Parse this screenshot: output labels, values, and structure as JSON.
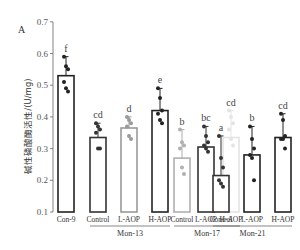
{
  "panel_label": "A",
  "chart_data": {
    "type": "bar",
    "title": "",
    "xlabel": "",
    "ylabel": "碱性磷酸酶活性/(U/mg)",
    "ylim": [
      0.1,
      0.7
    ],
    "yticks": [
      0.1,
      0.2,
      0.3,
      0.4,
      0.5,
      0.6,
      0.7
    ],
    "grid": false,
    "legend": "none",
    "categories": [
      "Con-9",
      "Control",
      "L-AOP",
      "H-AOP",
      "Control",
      "L-AOP",
      "H-AOP",
      "Control",
      "L-AOP",
      "H-AOP"
    ],
    "groups": [
      {
        "label": "",
        "categories": [
          "Con-9"
        ]
      },
      {
        "label": "Mon-13",
        "categories": [
          "Control",
          "L-AOP",
          "H-AOP"
        ]
      },
      {
        "label": "Mon-17",
        "categories": [
          "Control",
          "L-AOP",
          "H-AOP"
        ]
      },
      {
        "label": "Mon-21",
        "categories": [
          "Control",
          "L-AOP",
          "H-AOP"
        ]
      }
    ],
    "values": [
      0.53,
      0.335,
      0.365,
      0.42,
      0.27,
      0.305,
      0.335,
      0.215,
      0.28,
      0.335
    ],
    "error_top": [
      0.59,
      0.38,
      0.4,
      0.49,
      0.36,
      0.37,
      0.42,
      0.34,
      0.37,
      0.41
    ],
    "significance_letters": [
      "f",
      "cd",
      "d",
      "e",
      "b",
      "bc",
      "cd",
      "a",
      "b",
      "cd"
    ],
    "bar_colors": [
      "#222222",
      "#333333",
      "#9a9a9a",
      "#222222",
      "#b0b0b0",
      "#333333",
      "#e4e4e4",
      "#333333",
      "#222222",
      "#222222"
    ],
    "points": [
      [
        0.59,
        0.56,
        0.55,
        0.51,
        0.49,
        0.48
      ],
      [
        0.38,
        0.37,
        0.36,
        0.35,
        0.3,
        0.3
      ],
      [
        0.4,
        0.39,
        0.38,
        0.37,
        0.34,
        0.33
      ],
      [
        0.49,
        0.46,
        0.42,
        0.41,
        0.39,
        0.38
      ],
      [
        0.36,
        0.32,
        0.31,
        0.3,
        0.24,
        0.22
      ],
      [
        0.37,
        0.34,
        0.32,
        0.31,
        0.3,
        0.29
      ],
      [
        0.42,
        0.4,
        0.38,
        0.36,
        0.33,
        0.31
      ],
      [
        0.34,
        0.27,
        0.24,
        0.2,
        0.19,
        0.18
      ],
      [
        0.37,
        0.33,
        0.3,
        0.28,
        0.27,
        0.2
      ],
      [
        0.41,
        0.39,
        0.34,
        0.33,
        0.33,
        0.3
      ]
    ]
  }
}
